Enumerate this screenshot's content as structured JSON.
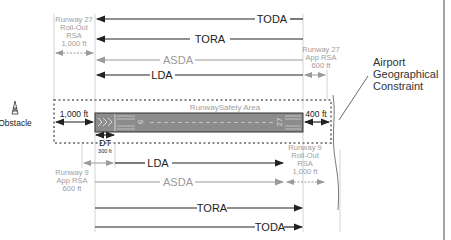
{
  "colors": {
    "dark": "#222222",
    "gray": "#9a9a9a",
    "light_gray": "#b5b5b5",
    "runway_fill": "#8c8c8c",
    "dashed": "#8a8a8a"
  },
  "top_distances": {
    "toda": "TODA",
    "tora": "TORA",
    "asda": "ASDA",
    "lda": "LDA"
  },
  "bottom_distances": {
    "lda": "LDA",
    "asda": "ASDA",
    "tora": "TORA",
    "toda": "TODA"
  },
  "rsa_labels": {
    "rwy27_rollout": [
      "Runway 27",
      "Roll-Out",
      "RSA",
      "1,000 ft"
    ],
    "rwy27_app": [
      "Runway 27",
      "App RSA",
      "600 ft"
    ],
    "rwy9_app": [
      "Runway 9",
      "App RSA",
      "600 ft"
    ],
    "rwy9_rollout": [
      "Runway 9",
      "Roll-Out",
      "RSA",
      "1,000 ft"
    ]
  },
  "runway": {
    "safety_area_label": "RunwaySafety Area",
    "left_number": "9",
    "right_number": "27",
    "left_offset": "1,000 ft",
    "right_offset": "400 ft",
    "dt_label": "DT",
    "dt_value": "300 ft"
  },
  "obstacle_label": "Obstacle",
  "constraint_label": [
    "Airport",
    "Geographical",
    "Constraint"
  ]
}
